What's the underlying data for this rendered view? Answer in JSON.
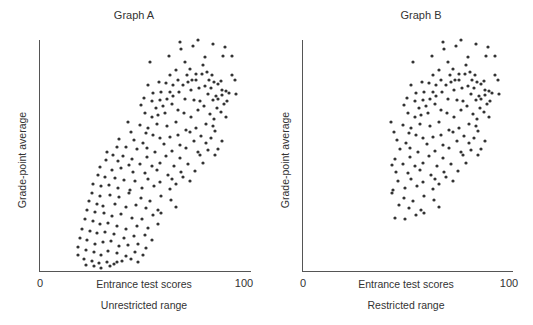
{
  "chart_data": [
    {
      "type": "scatter",
      "title": "Graph A",
      "xlabel": "Entrance test scores",
      "ylabel": "Grade-point average",
      "subtitle": "Unrestricted range",
      "xlim": [
        0,
        100
      ],
      "x_ticks": [
        "0",
        "100"
      ],
      "grid": false,
      "points_px": [
        [
          198,
          40
        ],
        [
          213,
          44
        ],
        [
          180,
          42
        ],
        [
          225,
          47
        ],
        [
          193,
          46
        ],
        [
          181,
          49
        ],
        [
          205,
          57
        ],
        [
          169,
          56
        ],
        [
          223,
          56
        ],
        [
          232,
          56
        ],
        [
          150,
          62
        ],
        [
          185,
          62
        ],
        [
          203,
          65
        ],
        [
          190,
          69
        ],
        [
          176,
          70
        ],
        [
          170,
          75
        ],
        [
          187,
          75
        ],
        [
          196,
          74
        ],
        [
          202,
          74
        ],
        [
          212,
          75
        ],
        [
          207,
          72
        ],
        [
          232,
          75
        ],
        [
          235,
          80
        ],
        [
          166,
          83
        ],
        [
          178,
          80
        ],
        [
          192,
          80
        ],
        [
          196,
          80
        ],
        [
          209,
          80
        ],
        [
          214,
          82
        ],
        [
          221,
          81
        ],
        [
          218,
          84
        ],
        [
          148,
          85
        ],
        [
          159,
          82
        ],
        [
          173,
          85
        ],
        [
          183,
          85
        ],
        [
          188,
          82
        ],
        [
          205,
          86
        ],
        [
          211,
          88
        ],
        [
          222,
          90
        ],
        [
          226,
          91
        ],
        [
          153,
          93
        ],
        [
          161,
          92
        ],
        [
          170,
          92
        ],
        [
          179,
          92
        ],
        [
          191,
          90
        ],
        [
          199,
          88
        ],
        [
          208,
          94
        ],
        [
          216,
          96
        ],
        [
          236,
          94
        ],
        [
          144,
          98
        ],
        [
          152,
          101
        ],
        [
          160,
          100
        ],
        [
          167,
          99
        ],
        [
          173,
          96
        ],
        [
          185,
          99
        ],
        [
          194,
          100
        ],
        [
          200,
          101
        ],
        [
          213,
          100
        ],
        [
          218,
          99
        ],
        [
          222,
          95
        ],
        [
          229,
          93
        ],
        [
          141,
          105
        ],
        [
          156,
          108
        ],
        [
          163,
          106
        ],
        [
          172,
          104
        ],
        [
          178,
          110
        ],
        [
          198,
          110
        ],
        [
          204,
          106
        ],
        [
          217,
          108
        ],
        [
          224,
          104
        ],
        [
          227,
          101
        ],
        [
          145,
          113
        ],
        [
          152,
          117
        ],
        [
          158,
          115
        ],
        [
          165,
          113
        ],
        [
          184,
          113
        ],
        [
          191,
          117
        ],
        [
          210,
          114
        ],
        [
          214,
          119
        ],
        [
          221,
          112
        ],
        [
          226,
          117
        ],
        [
          128,
          122
        ],
        [
          140,
          125
        ],
        [
          148,
          128
        ],
        [
          157,
          124
        ],
        [
          167,
          126
        ],
        [
          176,
          122
        ],
        [
          186,
          130
        ],
        [
          196,
          128
        ],
        [
          206,
          124
        ],
        [
          213,
          126
        ],
        [
          131,
          132
        ],
        [
          146,
          133
        ],
        [
          153,
          135
        ],
        [
          160,
          138
        ],
        [
          170,
          137
        ],
        [
          178,
          135
        ],
        [
          190,
          132
        ],
        [
          201,
          136
        ],
        [
          211,
          138
        ],
        [
          215,
          131
        ],
        [
          119,
          139
        ],
        [
          134,
          140
        ],
        [
          143,
          143
        ],
        [
          164,
          144
        ],
        [
          180,
          145
        ],
        [
          194,
          141
        ],
        [
          206,
          143
        ],
        [
          222,
          141
        ],
        [
          117,
          147
        ],
        [
          126,
          147
        ],
        [
          137,
          149
        ],
        [
          147,
          148
        ],
        [
          155,
          152
        ],
        [
          172,
          151
        ],
        [
          186,
          148
        ],
        [
          198,
          152
        ],
        [
          208,
          150
        ],
        [
          218,
          149
        ],
        [
          107,
          152
        ],
        [
          113,
          155
        ],
        [
          123,
          156
        ],
        [
          132,
          159
        ],
        [
          147,
          157
        ],
        [
          166,
          156
        ],
        [
          180,
          158
        ],
        [
          200,
          155
        ],
        [
          215,
          155
        ],
        [
          106,
          160
        ],
        [
          118,
          161
        ],
        [
          129,
          165
        ],
        [
          140,
          164
        ],
        [
          152,
          166
        ],
        [
          160,
          163
        ],
        [
          174,
          166
        ],
        [
          188,
          164
        ],
        [
          203,
          163
        ],
        [
          100,
          167
        ],
        [
          112,
          170
        ],
        [
          121,
          168
        ],
        [
          133,
          172
        ],
        [
          145,
          173
        ],
        [
          157,
          170
        ],
        [
          168,
          175
        ],
        [
          181,
          172
        ],
        [
          195,
          171
        ],
        [
          98,
          175
        ],
        [
          105,
          177
        ],
        [
          115,
          178
        ],
        [
          124,
          180
        ],
        [
          135,
          181
        ],
        [
          148,
          179
        ],
        [
          160,
          182
        ],
        [
          172,
          179
        ],
        [
          183,
          177
        ],
        [
          190,
          181
        ],
        [
          93,
          184
        ],
        [
          101,
          186
        ],
        [
          109,
          185
        ],
        [
          118,
          188
        ],
        [
          130,
          190
        ],
        [
          142,
          188
        ],
        [
          154,
          186
        ],
        [
          170,
          189
        ],
        [
          176,
          184
        ],
        [
          92,
          193
        ],
        [
          100,
          196
        ],
        [
          110,
          195
        ],
        [
          119,
          197
        ],
        [
          129,
          193
        ],
        [
          141,
          198
        ],
        [
          150,
          201
        ],
        [
          161,
          196
        ],
        [
          171,
          200
        ],
        [
          89,
          201
        ],
        [
          97,
          204
        ],
        [
          103,
          206
        ],
        [
          115,
          204
        ],
        [
          126,
          207
        ],
        [
          136,
          205
        ],
        [
          146,
          208
        ],
        [
          158,
          210
        ],
        [
          176,
          207
        ],
        [
          87,
          210
        ],
        [
          95,
          212
        ],
        [
          104,
          213
        ],
        [
          112,
          216
        ],
        [
          121,
          214
        ],
        [
          132,
          218
        ],
        [
          142,
          219
        ],
        [
          153,
          215
        ],
        [
          161,
          213
        ],
        [
          85,
          219
        ],
        [
          93,
          221
        ],
        [
          100,
          224
        ],
        [
          108,
          223
        ],
        [
          117,
          226
        ],
        [
          126,
          229
        ],
        [
          137,
          226
        ],
        [
          148,
          228
        ],
        [
          158,
          224
        ],
        [
          82,
          229
        ],
        [
          90,
          231
        ],
        [
          97,
          233
        ],
        [
          105,
          232
        ],
        [
          114,
          234
        ],
        [
          124,
          238
        ],
        [
          134,
          236
        ],
        [
          145,
          235
        ],
        [
          152,
          240
        ],
        [
          80,
          238
        ],
        [
          87,
          240
        ],
        [
          95,
          244
        ],
        [
          103,
          242
        ],
        [
          111,
          241
        ],
        [
          119,
          246
        ],
        [
          128,
          245
        ],
        [
          138,
          244
        ],
        [
          146,
          248
        ],
        [
          78,
          247
        ],
        [
          86,
          250
        ],
        [
          94,
          252
        ],
        [
          101,
          255
        ],
        [
          108,
          251
        ],
        [
          117,
          253
        ],
        [
          126,
          256
        ],
        [
          135,
          252
        ],
        [
          143,
          255
        ],
        [
          78,
          255
        ],
        [
          84,
          259
        ],
        [
          92,
          261
        ],
        [
          99,
          263
        ],
        [
          107,
          262
        ],
        [
          114,
          264
        ],
        [
          122,
          261
        ],
        [
          131,
          259
        ],
        [
          138,
          262
        ],
        [
          86,
          265
        ],
        [
          94,
          266
        ],
        [
          101,
          268
        ],
        [
          110,
          266
        ],
        [
          117,
          262
        ]
      ]
    },
    {
      "type": "scatter",
      "title": "Graph B",
      "xlabel": "Entrance test scores",
      "ylabel": "Grade-point average",
      "subtitle": "Restricted range",
      "xlim": [
        0,
        100
      ],
      "x_ticks": [
        "0",
        "100"
      ],
      "grid": false,
      "note": "Same data as Graph A restricted to higher entrance test scores (roughly x >= 44)"
    }
  ],
  "graphA": {
    "title": "Graph A",
    "ylabel": "Grade-point average",
    "xlabel": "Entrance test scores",
    "subtitle": "Unrestricted range",
    "tick_min": "0",
    "tick_max": "100"
  },
  "graphB": {
    "title": "Graph B",
    "ylabel": "Grade-point average",
    "xlabel": "Entrance test scores",
    "subtitle": "Restricted range",
    "tick_min": "0",
    "tick_max": "100"
  },
  "colors": {
    "dot": "#333333",
    "axis": "#555555",
    "text": "#333333"
  }
}
